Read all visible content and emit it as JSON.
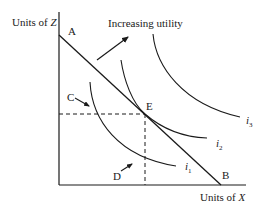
{
  "diagram": {
    "title": "Increasing utility",
    "axes": {
      "y_label": "Units of Z",
      "y_label_prefix": "Units of ",
      "y_label_var": "Z",
      "x_label": "Units of X",
      "x_label_prefix": "Units of ",
      "x_label_var": "X"
    },
    "budget_line": {
      "start_label": "A",
      "end_label": "B"
    },
    "points": {
      "tangency": "E",
      "c_point": "C",
      "d_point": "D"
    },
    "indifference_curves": [
      {
        "name": "i",
        "sub": "1"
      },
      {
        "name": "i",
        "sub": "2"
      },
      {
        "name": "i",
        "sub": "3"
      }
    ],
    "colors": {
      "line": "#1a1a1a",
      "background": "#ffffff"
    }
  }
}
